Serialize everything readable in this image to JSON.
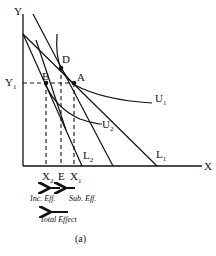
{
  "diagram": {
    "axes": {
      "y_label": "Y",
      "x_label": "X"
    },
    "levels": {
      "y1_label": "Y",
      "y1_sub": "1"
    },
    "points": {
      "A": "A",
      "B": "B",
      "D": "D"
    },
    "curves": {
      "U1": {
        "label": "U",
        "sub": "1"
      },
      "U2": {
        "label": "U",
        "sub": "2"
      }
    },
    "budget_lines": {
      "L1": {
        "label": "L",
        "sub": "1"
      },
      "L2": {
        "label": "L",
        "sub": "2"
      }
    },
    "x_ticks": {
      "X2": {
        "label": "X",
        "sub": "2"
      },
      "E": {
        "label": "E"
      },
      "X1": {
        "label": "X",
        "sub": "1"
      }
    },
    "effects": {
      "income": "Inc. Eff.",
      "substitution": "Sub. Eff.",
      "total": "Total Effect"
    },
    "caption": "(a)",
    "colors": {
      "ink": "#111111",
      "background": "#ffffff"
    }
  }
}
